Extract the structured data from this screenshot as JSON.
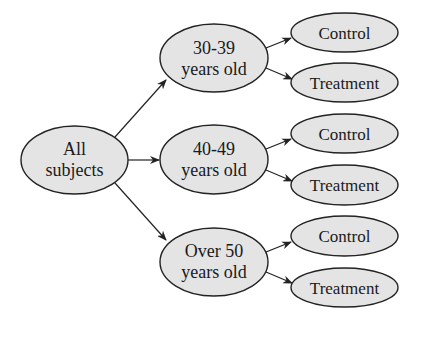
{
  "diagram": {
    "type": "tree",
    "root": {
      "label_line1": "All",
      "label_line2": "subjects"
    },
    "groups": [
      {
        "label_line1": "30-39",
        "label_line2": "years old",
        "children": [
          "Control",
          "Treatment"
        ]
      },
      {
        "label_line1": "40-49",
        "label_line2": "years old",
        "children": [
          "Control",
          "Treatment"
        ]
      },
      {
        "label_line1": "Over 50",
        "label_line2": "years old",
        "children": [
          "Control",
          "Treatment"
        ]
      }
    ],
    "colors": {
      "node_fill": "#e4e4e4",
      "stroke": "#222222"
    }
  }
}
